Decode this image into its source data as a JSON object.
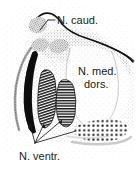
{
  "figure": {
    "name": "thalamus-nuclei-cross-section",
    "caption_present": false,
    "background_color": "#ffffff",
    "ink_color": "#1a1a1a",
    "width_px": 136,
    "height_px": 171
  },
  "labels": {
    "caudate": "N. caud.",
    "medial_dorsal_line1": "N. med.",
    "medial_dorsal_line2": "dors.",
    "ventral": "N. ventr."
  },
  "structures": {
    "reticular_lamina": {
      "name": "reticular-lamina",
      "fill": "dotted-outline",
      "color": "#2b2b2b"
    },
    "solid_crescent": {
      "name": "solid-black-crescent-nucleus",
      "fill": "solid",
      "color": "#0d0d0d"
    },
    "hatched_nucleus": {
      "name": "diagonal-hatched-nucleus",
      "fill": "diagonal-hatch",
      "color": "#1a1a1a"
    },
    "striped_nucleus": {
      "name": "horizontal-striped-nucleus",
      "fill": "horizontal-stripe",
      "color": "#1a1a1a"
    },
    "checkered_nucleus": {
      "name": "checkered-dot-nucleus",
      "fill": "checker-dots",
      "color": "#1a1a1a"
    },
    "caudate_blobs": {
      "name": "caudate-gray-blobs",
      "fill": "coarse-stipple",
      "color": "#8f8f8f",
      "count": 3
    },
    "medial_dorsal_field": {
      "name": "medial-dorsal-stipple-field",
      "fill": "fine-stipple",
      "color": "#b5b5b5"
    }
  },
  "leader_lines": {
    "caudate": {
      "name": "leader-line-caudate",
      "from": "N. caud.",
      "targets": 1
    },
    "ventral": {
      "name": "leader-line-ventral-fan",
      "from": "N. ventr.",
      "targets": 4,
      "converge_point": [
        35,
        143
      ]
    }
  }
}
